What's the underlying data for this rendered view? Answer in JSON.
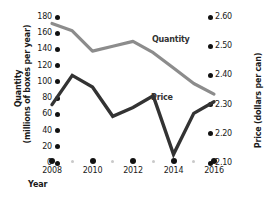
{
  "chart_data": {
    "type": "line",
    "title": "",
    "xlabel": "Year",
    "x": [
      2008,
      2009,
      2010,
      2011,
      2012,
      2013,
      2014,
      2015,
      2016
    ],
    "x_major": [
      2008,
      2010,
      2012,
      2014,
      2016
    ],
    "x_minor": [
      2009,
      2011,
      2013,
      2015
    ],
    "grid": false,
    "legend_position": "inline",
    "series": [
      {
        "name": "Quantity",
        "axis": "left",
        "color": "#8c8c8c",
        "values": [
          172,
          163,
          138,
          144,
          150,
          136,
          117,
          98,
          85
        ]
      },
      {
        "name": "Price",
        "axis": "right",
        "color": "#333333",
        "values": [
          2.3,
          2.4,
          2.36,
          2.26,
          2.29,
          2.33,
          2.13,
          2.27,
          2.31
        ]
      }
    ],
    "left_axis": {
      "label_line1": "Quantity",
      "label_line2": "(millions of boxes per year)",
      "ticks": [
        "180",
        "160",
        "140",
        "120",
        "100",
        "80",
        "60",
        "40",
        "20",
        "0"
      ],
      "tick_values": [
        180,
        160,
        140,
        120,
        100,
        80,
        60,
        40,
        20,
        0
      ],
      "min": 0,
      "max": 180
    },
    "right_axis": {
      "label": "Price (dollars per can)",
      "ticks": [
        "2.60",
        "2.50",
        "2.40",
        "2.30",
        "2.20",
        "2.10"
      ],
      "tick_values": [
        2.6,
        2.5,
        2.4,
        2.3,
        2.2,
        2.1
      ],
      "min": 2.1,
      "max": 2.6
    },
    "annotations": [
      {
        "text": "Quantity",
        "series": "Quantity"
      },
      {
        "text": "Price",
        "series": "Price"
      }
    ]
  }
}
